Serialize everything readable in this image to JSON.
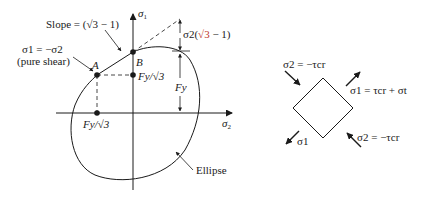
{
  "diagram": {
    "yield_plot": {
      "axis_labels": {
        "vertical": "σ1",
        "horizontal": "σ2"
      },
      "slope_label": "Slope = (√3 − 1)",
      "slope_prefix": "Slope = (",
      "slope_sqrt": "√3",
      "slope_suffix": " − 1)",
      "point_a_label": "A",
      "point_b_label": "B",
      "pure_shear_eq": "σ1 = −σ2",
      "pure_shear_note": "(pure shear)",
      "fy_sqrt3_vertical": "Fy/√3",
      "fy_sqrt3_horizontal": "Fy/√3",
      "fy_label": "Fy",
      "sigma2_term_prefix": "σ2(",
      "sigma2_term_sqrt": "√3",
      "sigma2_term_suffix": " − 1)",
      "ellipse_label": "Ellipse"
    },
    "element": {
      "top_left_label": "σ2 = −τcr",
      "top_right_label": "σ1 = τcr + σt",
      "bottom_left_label": "σ1",
      "bottom_right_label": "σ2 = −τcr"
    }
  }
}
